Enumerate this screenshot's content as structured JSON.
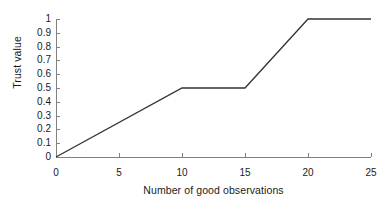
{
  "chart_data": {
    "type": "line",
    "title": "",
    "xlabel": "Number of good observations",
    "ylabel": "Trust value",
    "xlim": [
      0,
      25
    ],
    "ylim": [
      0,
      1
    ],
    "grid": false,
    "legend": null,
    "xticks": [
      "0",
      "5",
      "10",
      "15",
      "20",
      "25"
    ],
    "xtick_values": [
      0,
      5,
      10,
      15,
      20,
      25
    ],
    "yticks": [
      "0",
      "0.1",
      "0.2",
      "0.3",
      "0.4",
      "0.5",
      "0.6",
      "0.7",
      "0.8",
      "0.9",
      "1"
    ],
    "ytick_values": [
      0,
      0.1,
      0.2,
      0.3,
      0.4,
      0.5,
      0.6,
      0.7,
      0.8,
      0.9,
      1
    ],
    "series": [
      {
        "name": "Trust value",
        "x": [
          0,
          10,
          15,
          20,
          25
        ],
        "values": [
          0,
          0.5,
          0.5,
          1,
          1
        ],
        "color": "#333333"
      }
    ],
    "colors": {
      "line": "#333333",
      "axis": "#808080",
      "background": "#ffffff",
      "text": "#1a1a1a"
    }
  }
}
